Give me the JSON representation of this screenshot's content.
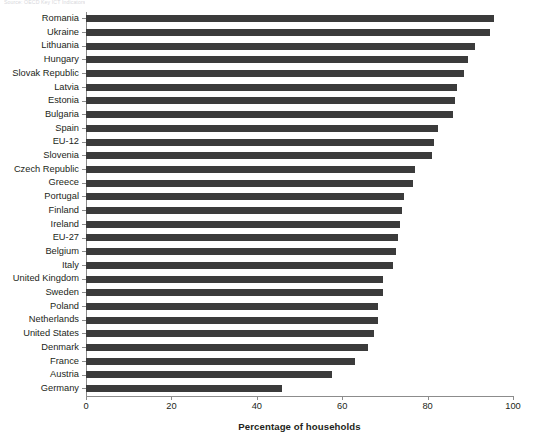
{
  "top_caption": "Source: OECD Key ICT Indicators",
  "chart_data": {
    "type": "bar",
    "orientation": "horizontal",
    "title": "",
    "xlabel": "Percentage of households",
    "ylabel": "",
    "xlim": [
      0,
      100
    ],
    "xticks": [
      0,
      20,
      40,
      60,
      80,
      100
    ],
    "grid": false,
    "legend": null,
    "bar_color": "#3b3b3b",
    "categories": [
      "Romania",
      "Ukraine",
      "Lithuania",
      "Hungary",
      "Slovak Republic",
      "Latvia",
      "Estonia",
      "Bulgaria",
      "Spain",
      "EU-12",
      "Slovenia",
      "Czech Republic",
      "Greece",
      "Portugal",
      "Finland",
      "Ireland",
      "EU-27",
      "Belgium",
      "Italy",
      "United Kingdom",
      "Sweden",
      "Poland",
      "Netherlands",
      "United States",
      "Denmark",
      "France",
      "Austria",
      "Germany"
    ],
    "values": [
      95.5,
      94.5,
      91.0,
      89.5,
      88.5,
      87.0,
      86.5,
      86.0,
      82.5,
      81.5,
      81.0,
      77.0,
      76.5,
      74.5,
      74.0,
      73.5,
      73.0,
      72.5,
      72.0,
      69.5,
      69.5,
      68.5,
      68.5,
      67.5,
      66.0,
      63.0,
      57.5,
      46.0
    ]
  }
}
